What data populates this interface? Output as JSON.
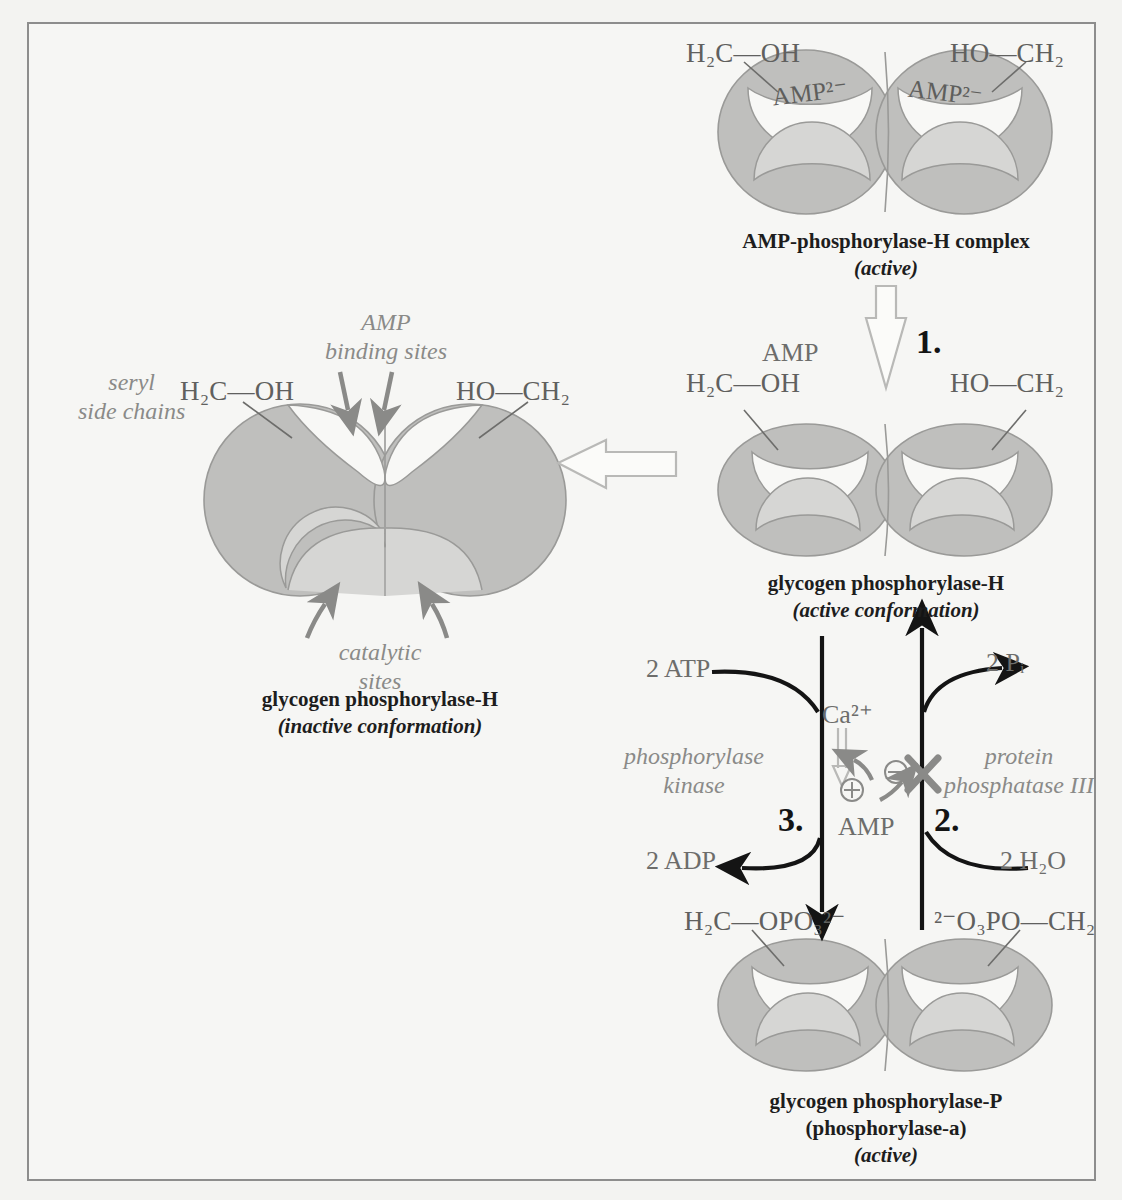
{
  "figure": {
    "title_visible": false,
    "background_color": "#f3f3f1",
    "frame_color": "#8d8d8d"
  },
  "colors": {
    "lobe_fill": "#bfbfbd",
    "lobe_light": "#d6d6d4",
    "lobe_stroke": "#9a9a98",
    "white_site": "#f8f8f6",
    "grey_text": "#8a8a88",
    "dark_text": "#1d1d1d",
    "arrow_black": "#141414",
    "hollow_arrow_stroke": "#b9b9b7"
  },
  "structures": {
    "amp_complex": {
      "caption_line1": "AMP-phosphorylase-H complex",
      "caption_line2": "(active)",
      "left_serine": "H₂C—OH",
      "right_serine": "HO—CH₂",
      "site_label_left": "AMP²⁻",
      "site_label_right": "AMP²⁻",
      "shape": "ellipse-dimer"
    },
    "active_h": {
      "caption_line1": "glycogen phosphorylase-H",
      "caption_line2": "(active conformation)",
      "left_serine": "H₂C—OH",
      "right_serine": "HO—CH₂",
      "shape": "ellipse-dimer"
    },
    "inactive_h": {
      "caption_line1": "glycogen phosphorylase-H",
      "caption_line2": "(inactive conformation)",
      "left_serine": "H₂C—OH",
      "right_serine": "HO—CH₂",
      "shape": "circle-dimer"
    },
    "phospho_p": {
      "caption_line1": "glycogen phosphorylase-P",
      "caption_line2": "(phosphorylase-a)",
      "caption_line3": "(active)",
      "left_serine": "H₂C—OPO₃²⁻",
      "right_serine": "²⁻O₃PO—CH₂",
      "shape": "ellipse-dimer"
    }
  },
  "annotations": {
    "seryl_side_chains_line1": "seryl",
    "seryl_side_chains_line2": "side chains",
    "amp_binding_sites_line1": "AMP",
    "amp_binding_sites_line2": "binding sites",
    "catalytic_sites_line1": "catalytic",
    "catalytic_sites_line2": "sites"
  },
  "reaction": {
    "step1_number": "1.",
    "step1_ligand": "AMP",
    "step2_number": "2.",
    "step2_enzyme_line1": "protein",
    "step2_enzyme_line2": "phosphatase III",
    "step2_substrate": "2 H₂O",
    "step2_product": "2 Pᵢ",
    "step3_number": "3.",
    "step3_enzyme_line1": "phosphorylase",
    "step3_enzyme_line2": "kinase",
    "step3_substrate": "2 ATP",
    "step3_product": "2 ADP",
    "activator": "Ca²⁺",
    "activator_sign": "⊕",
    "inhibitor": "AMP",
    "inhibitor_sign": "⊖",
    "block_marker": "X"
  }
}
